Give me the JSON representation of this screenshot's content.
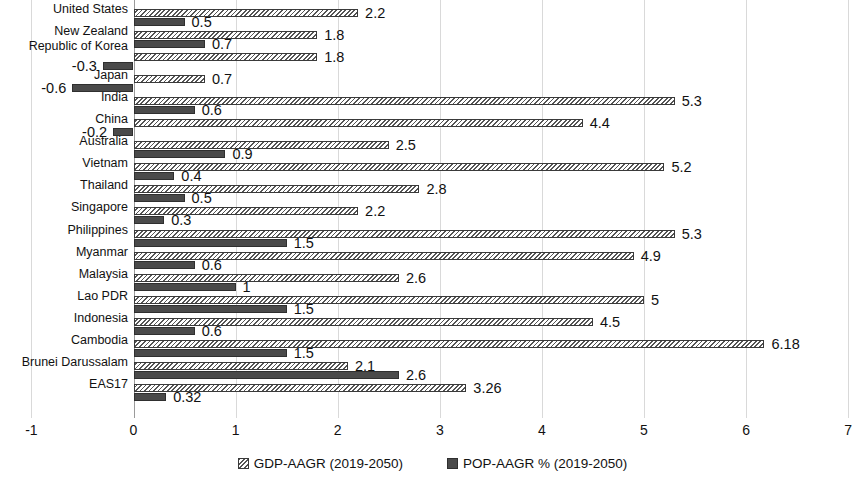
{
  "chart_data": {
    "type": "bar",
    "orientation": "horizontal",
    "title": "",
    "xlabel": "",
    "ylabel": "",
    "xlim": [
      -1,
      7
    ],
    "xticks": [
      "-1",
      "0",
      "1",
      "2",
      "3",
      "4",
      "5",
      "6",
      "7"
    ],
    "grid": true,
    "legend_position": "bottom",
    "categories": [
      "United States",
      "New Zealand",
      "Republic of Korea",
      "Japan",
      "India",
      "China",
      "Australia",
      "Vietnam",
      "Thailand",
      "Singapore",
      "Philippines",
      "Myanmar",
      "Malaysia",
      "Lao PDR",
      "Indonesia",
      "Cambodia",
      "Brunei Darussalam",
      "EAS17"
    ],
    "series": [
      {
        "name": "GDP-AAGR (2019-2050)",
        "key": "gdp",
        "color": "#555555",
        "pattern": "diagonal-hatch",
        "values": [
          2.2,
          1.8,
          1.8,
          0.7,
          5.3,
          4.4,
          2.5,
          5.2,
          2.8,
          2.2,
          5.3,
          4.9,
          2.6,
          5,
          4.5,
          6.18,
          2.1,
          3.26
        ],
        "labels": [
          "2.2",
          "1.8",
          "1.8",
          "0.7",
          "5.3",
          "4.4",
          "2.5",
          "5.2",
          "2.8",
          "2.2",
          "5.3",
          "4.9",
          "2.6",
          "5",
          "4.5",
          "6.18",
          "2.1",
          "3.26"
        ]
      },
      {
        "name": "POP-AAGR % (2019-2050)",
        "key": "pop",
        "color": "#4a4a4a",
        "pattern": "solid",
        "values": [
          0.5,
          0.7,
          -0.3,
          -0.6,
          0.6,
          -0.2,
          0.9,
          0.4,
          0.5,
          0.3,
          1.5,
          0.6,
          1,
          1.5,
          0.6,
          1.5,
          2.6,
          0.32
        ],
        "labels": [
          "0.5",
          "0.7",
          "-0.3",
          "-0.6",
          "0.6",
          "-0.2",
          "0.9",
          "0.4",
          "0.5",
          "0.3",
          "1.5",
          "0.6",
          "1",
          "1.5",
          "0.6",
          "1.5",
          "2.6",
          "0.32"
        ]
      }
    ]
  },
  "legend": {
    "items": [
      {
        "label": "GDP-AAGR (2019-2050)",
        "key": "gdp"
      },
      {
        "label": "POP-AAGR % (2019-2050)",
        "key": "pop"
      }
    ]
  }
}
